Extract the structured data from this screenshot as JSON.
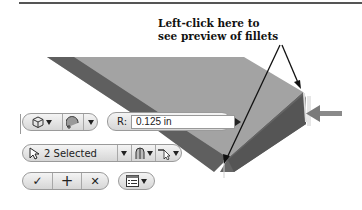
{
  "callout": {
    "line1": "Left-click here to",
    "line2": "see preview of fillets"
  },
  "toolbar": {
    "row1": {
      "solid_select_icon": "solid-body-icon",
      "fillet_mode_icon": "fillet-mode-icon",
      "radius_label": "R:",
      "radius_value": "0.125 in",
      "apply_arrow_icon": "play-arrow-icon"
    },
    "row2": {
      "selection_label": "2 Selected",
      "selection_icon": "cursor-icon",
      "edge_chain_icon": "edge-chain-icon",
      "select_filter_icon": "select-filter-icon"
    },
    "row3": {
      "ok_symbol": "✓",
      "apply_symbol": "+",
      "cancel_symbol": "✕",
      "options_icon": "list-options-icon"
    }
  },
  "colors": {
    "model_top": "#9e9e9e",
    "model_side_dark": "#5a5a5a",
    "model_front": "#6e6e6e",
    "arrow": "#111111",
    "glyph_arrow": "#8a8a8a"
  }
}
